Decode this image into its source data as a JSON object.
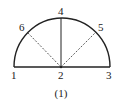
{
  "diagram": {
    "type": "semicircle-division",
    "caption": "(1)",
    "stroke_color": "#222222",
    "points": [
      {
        "id": "1",
        "label": "1",
        "x": 14,
        "y": 67,
        "label_x": 11,
        "label_y": 79
      },
      {
        "id": "2",
        "label": "2",
        "x": 61,
        "y": 67,
        "label_x": 58,
        "label_y": 79
      },
      {
        "id": "3",
        "label": "3",
        "x": 110,
        "y": 67,
        "label_x": 106,
        "label_y": 79
      },
      {
        "id": "4",
        "label": "4",
        "x": 61,
        "y": 18,
        "label_x": 58,
        "label_y": 15
      },
      {
        "id": "5",
        "label": "5",
        "x": 96,
        "y": 32,
        "label_x": 98,
        "label_y": 31
      },
      {
        "id": "6",
        "label": "6",
        "x": 27,
        "y": 32,
        "label_x": 19,
        "label_y": 31
      }
    ],
    "edges": [
      {
        "from": "1",
        "to": "3",
        "style": "solid",
        "kind": "diameter"
      },
      {
        "from": "2",
        "to": "4",
        "style": "solid",
        "kind": "radius"
      },
      {
        "from": "2",
        "to": "5",
        "style": "dashed",
        "kind": "radius"
      },
      {
        "from": "2",
        "to": "6",
        "style": "dashed",
        "kind": "radius"
      },
      {
        "from": "1",
        "to": "3",
        "style": "solid",
        "kind": "arc",
        "via": "4"
      }
    ]
  }
}
